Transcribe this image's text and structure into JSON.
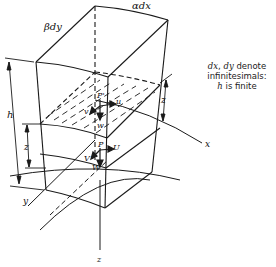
{
  "diagram": {
    "type": "3d-column-element",
    "labels": {
      "beta_dy": "βdy",
      "alpha_dx": "αdx",
      "h_dim": "h",
      "z_dim_left": "z",
      "z_dim_right": "z",
      "x_axis": "x",
      "y_axis": "y",
      "z_axis": "z",
      "P_prime": "P'",
      "u": "u",
      "v": "v",
      "w": "w",
      "P": "P",
      "U": "U",
      "V": "V",
      "W": "W"
    },
    "note": {
      "line1_var1": "dx",
      "line1_sep": ", ",
      "line1_var2": "dy",
      "line1_text": " denote",
      "line2": "infinitesimals:",
      "line3_var": "h",
      "line3_text": " is finite"
    },
    "colors": {
      "stroke": "#1a1a1a",
      "background": "#ffffff"
    }
  }
}
